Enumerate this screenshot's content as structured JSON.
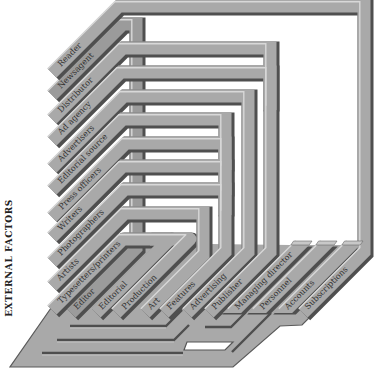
{
  "diagram": {
    "side_label": "EXTERNAL FACTORS",
    "external_factors": [
      "Reader",
      "Newsagent",
      "Distributor",
      "Ad agency",
      "Advertisers",
      "Editorial source",
      "Press officers",
      "Writers",
      "Photographers",
      "Artists",
      "Typesetters/printers"
    ],
    "departments": [
      "Editor",
      "Editorial",
      "Production",
      "Art",
      "Features",
      "Advertising",
      "Publisher",
      "Managing director",
      "Personnel",
      "Accounts",
      "Subscriptions"
    ],
    "colors": {
      "background": "#ffffff",
      "tube_face": "#a9a9a9",
      "spine_face": "#9b9b9b",
      "tube_shadow": "#4f4f4f",
      "tube_highlight": "#d8d8d8",
      "cap_top": "#c8c8c8",
      "label_text": "#333333"
    }
  }
}
